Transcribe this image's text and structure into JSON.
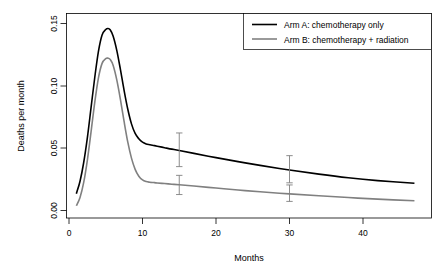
{
  "chart_data": {
    "type": "line",
    "title": "",
    "xlabel": "Months",
    "ylabel": "Deaths per month",
    "xlim": [
      0,
      47
    ],
    "ylim": [
      0.0,
      0.155
    ],
    "xticks": [
      0,
      10,
      20,
      30,
      40
    ],
    "xtick_labels": [
      "0",
      "10",
      "20",
      "30",
      "40"
    ],
    "yticks": [
      0.0,
      0.05,
      0.1,
      0.15
    ],
    "ytick_labels": [
      "0.00",
      "0.05",
      "0.10",
      "0.15"
    ],
    "grid": false,
    "legend_position": "top-right",
    "series": [
      {
        "name": "Arm A: chemotherapy only",
        "color": "#000000",
        "x": [
          1.0,
          1.5,
          2.0,
          2.5,
          3.0,
          3.5,
          4.0,
          4.5,
          5.0,
          5.3,
          5.6,
          6.0,
          6.5,
          7.0,
          7.5,
          8.0,
          8.5,
          9.0,
          9.5,
          10.0,
          10.5,
          11.0,
          11.5,
          12.0,
          13.0,
          14.0,
          15.0,
          17.0,
          20.0,
          23.0,
          26.0,
          30.0,
          34.0,
          38.0,
          42.0,
          47.0
        ],
        "y": [
          0.0135,
          0.0235,
          0.0385,
          0.0585,
          0.0825,
          0.1065,
          0.1275,
          0.1408,
          0.1452,
          0.146,
          0.145,
          0.14,
          0.1285,
          0.113,
          0.0962,
          0.0812,
          0.0695,
          0.0618,
          0.0575,
          0.0548,
          0.0534,
          0.0528,
          0.0522,
          0.0516,
          0.0504,
          0.0492,
          0.0481,
          0.0458,
          0.0424,
          0.0392,
          0.0362,
          0.0325,
          0.0292,
          0.0263,
          0.024,
          0.0218
        ]
      },
      {
        "name": "Arm B: chemotherapy + radiation",
        "color": "#808080",
        "x": [
          1.0,
          1.5,
          2.0,
          2.5,
          3.0,
          3.5,
          4.0,
          4.5,
          5.0,
          5.3,
          5.6,
          6.0,
          6.5,
          7.0,
          7.5,
          8.0,
          8.5,
          9.0,
          9.5,
          10.0,
          10.5,
          11.0,
          11.5,
          12.0,
          13.0,
          14.0,
          15.0,
          17.0,
          20.0,
          23.0,
          26.0,
          30.0,
          34.0,
          38.0,
          42.0,
          47.0
        ],
        "y": [
          0.0038,
          0.0105,
          0.0225,
          0.0405,
          0.063,
          0.0865,
          0.1062,
          0.118,
          0.1218,
          0.1222,
          0.1212,
          0.1165,
          0.1048,
          0.089,
          0.0712,
          0.0548,
          0.042,
          0.033,
          0.0275,
          0.0245,
          0.0232,
          0.0227,
          0.0224,
          0.0221,
          0.0216,
          0.0211,
          0.0206,
          0.0196,
          0.018,
          0.0164,
          0.015,
          0.0133,
          0.0118,
          0.0104,
          0.0091,
          0.0078
        ]
      }
    ],
    "error_bars": [
      {
        "series": "Arm A: chemotherapy only",
        "x": 15,
        "y": 0.0481,
        "low": 0.0352,
        "high": 0.0622,
        "color": "#808080"
      },
      {
        "series": "Arm A: chemotherapy only",
        "x": 30,
        "y": 0.0325,
        "low": 0.0222,
        "high": 0.044,
        "color": "#808080"
      },
      {
        "series": "Arm B: chemotherapy + radiation",
        "x": 15,
        "y": 0.0206,
        "low": 0.0128,
        "high": 0.0282,
        "color": "#808080"
      },
      {
        "series": "Arm B: chemotherapy + radiation",
        "x": 30,
        "y": 0.0133,
        "low": 0.0073,
        "high": 0.0205,
        "color": "#808080"
      }
    ],
    "legend": [
      {
        "label": "Arm A: chemotherapy only",
        "color": "#000000"
      },
      {
        "label": "Arm B: chemotherapy + radiation",
        "color": "#808080"
      }
    ]
  },
  "axes": {
    "x_label": "Months",
    "y_label": "Deaths per month",
    "x_ticks": [
      "0",
      "10",
      "20",
      "30",
      "40"
    ],
    "y_ticks": [
      "0.00",
      "0.05",
      "0.10",
      "0.15"
    ]
  },
  "legend": {
    "entry_a": "Arm A: chemotherapy only",
    "entry_b": "Arm B: chemotherapy + radiation"
  }
}
